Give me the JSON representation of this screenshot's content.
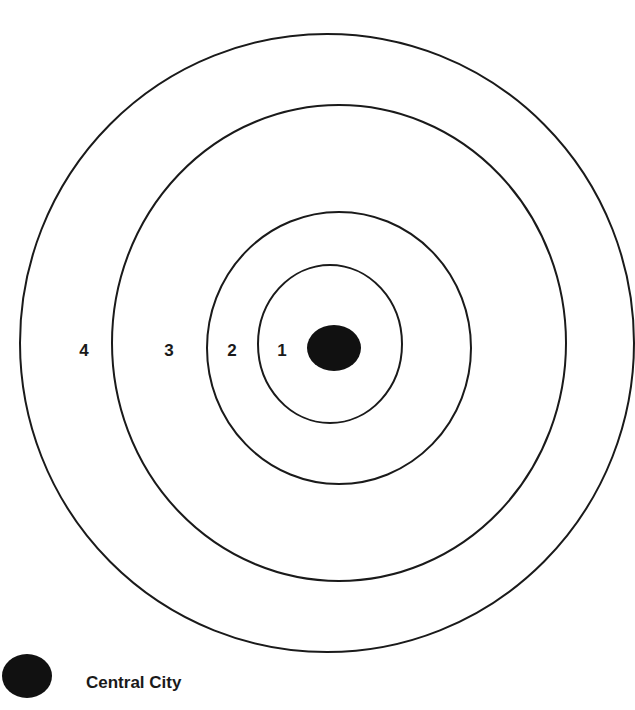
{
  "diagram": {
    "type": "concentric-zone-model",
    "colors": {
      "stroke": "#1a1a1a",
      "center_fill": "#111111",
      "background": "#ffffff"
    },
    "rings": [
      {
        "zone": "1",
        "cx": 330,
        "cy": 344,
        "rx": 72,
        "ry": 79
      },
      {
        "zone": "2",
        "cx": 339,
        "cy": 348,
        "rx": 132,
        "ry": 136
      },
      {
        "zone": "3",
        "cx": 339,
        "cy": 343,
        "rx": 227,
        "ry": 238
      },
      {
        "zone": "4",
        "cx": 327,
        "cy": 343,
        "rx": 307,
        "ry": 309
      }
    ],
    "zone_labels": [
      {
        "text": "4",
        "x": 84,
        "y": 356
      },
      {
        "text": "3",
        "x": 169,
        "y": 356
      },
      {
        "text": "2",
        "x": 232,
        "y": 356
      },
      {
        "text": "1",
        "x": 282,
        "y": 356
      }
    ],
    "center": {
      "cx": 334,
      "cy": 348,
      "rx": 27,
      "ry": 23
    }
  },
  "legend": {
    "items": [
      {
        "symbol": "black-filled-oval",
        "label": "Central City"
      }
    ]
  }
}
